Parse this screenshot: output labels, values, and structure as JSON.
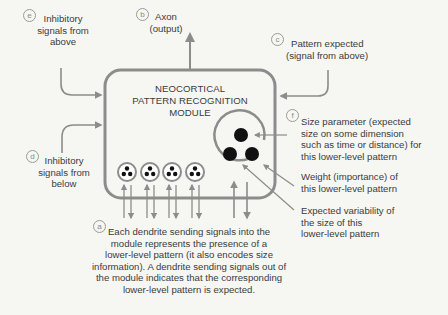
{
  "module": {
    "title_lines": [
      "NEOCORTICAL",
      "PATTERN RECOGNITION",
      "MODULE"
    ]
  },
  "labels": {
    "a": {
      "badge": "a",
      "lines": [
        "Each dendrite sending signals into the",
        "module represents the presence of a",
        "lower-level pattern (it also encodes size",
        "information). A dendrite sending signals out of",
        "the module indicates that the corresponding",
        "lower-level pattern is expected."
      ]
    },
    "b": {
      "badge": "b",
      "lines": [
        "Axon",
        "(output)"
      ]
    },
    "c": {
      "badge": "c",
      "lines": [
        "Pattern expected",
        "(signal from above)"
      ]
    },
    "d": {
      "badge": "d",
      "lines": [
        "Inhibitory",
        "signals from",
        "below"
      ]
    },
    "e": {
      "badge": "e",
      "lines": [
        "Inhibitory",
        "signals from",
        "above"
      ]
    },
    "f": {
      "badge": "f",
      "lines": [
        "Size parameter (expected",
        "size on some dimension",
        "such as time or distance) for",
        "this lower-level pattern"
      ]
    },
    "weight": {
      "lines": [
        "Weight (importance) of",
        "this lower-level pattern"
      ]
    },
    "variability": {
      "lines": [
        "Expected variability of",
        "the size of this",
        "lower-level pattern"
      ]
    }
  },
  "colors": {
    "stroke": "#8c8c8c",
    "dot": "#111111",
    "background": "#f6f6f3"
  }
}
